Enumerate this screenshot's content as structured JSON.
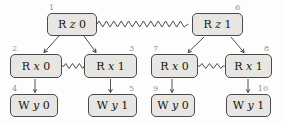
{
  "diagram_type": "event-graph",
  "colors": {
    "background": "#fdfdfd",
    "node_fill": "#e7e6e3",
    "node_border": "#4a4a4a",
    "edge": "#3a3a3a",
    "event_number": "#8f8f8f",
    "label_text": "#141414"
  },
  "nodes": [
    {
      "id": "1",
      "op": "R",
      "var": "z",
      "val": "0",
      "label": "R z 0",
      "number_corner": "top-left"
    },
    {
      "id": "2",
      "op": "R",
      "var": "x",
      "val": "0",
      "label": "R x 0",
      "number_corner": "top-left"
    },
    {
      "id": "3",
      "op": "R",
      "var": "x",
      "val": "1",
      "label": "R x 1",
      "number_corner": "top-right"
    },
    {
      "id": "4",
      "op": "W",
      "var": "y",
      "val": "0",
      "label": "W y 0",
      "number_corner": "top-left"
    },
    {
      "id": "5",
      "op": "W",
      "var": "y",
      "val": "1",
      "label": "W y 1",
      "number_corner": "top-right"
    },
    {
      "id": "6",
      "op": "R",
      "var": "z",
      "val": "1",
      "label": "R z 1",
      "number_corner": "top-right"
    },
    {
      "id": "7",
      "op": "R",
      "var": "x",
      "val": "0",
      "label": "R x 0",
      "number_corner": "top-left"
    },
    {
      "id": "8",
      "op": "R",
      "var": "x",
      "val": "1",
      "label": "R x 1",
      "number_corner": "top-right"
    },
    {
      "id": "9",
      "op": "W",
      "var": "y",
      "val": "0",
      "label": "W y 0",
      "number_corner": "top-left"
    },
    {
      "id": "10",
      "op": "W",
      "var": "y",
      "val": "1",
      "label": "W y 1",
      "number_corner": "top-right"
    }
  ],
  "edges": [
    {
      "from": "1",
      "to": "2",
      "style": "arrow"
    },
    {
      "from": "1",
      "to": "3",
      "style": "arrow"
    },
    {
      "from": "1",
      "to": "6",
      "style": "zigzag"
    },
    {
      "from": "2",
      "to": "3",
      "style": "zigzag"
    },
    {
      "from": "2",
      "to": "4",
      "style": "arrow"
    },
    {
      "from": "3",
      "to": "5",
      "style": "arrow"
    },
    {
      "from": "6",
      "to": "7",
      "style": "arrow"
    },
    {
      "from": "6",
      "to": "8",
      "style": "arrow"
    },
    {
      "from": "7",
      "to": "8",
      "style": "zigzag"
    },
    {
      "from": "7",
      "to": "9",
      "style": "arrow"
    },
    {
      "from": "8",
      "to": "10",
      "style": "arrow"
    }
  ]
}
